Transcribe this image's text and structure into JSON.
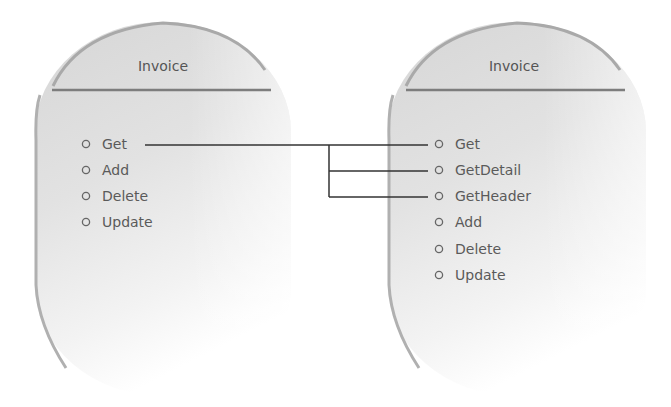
{
  "diagram": {
    "left_object": {
      "title": "Invoice",
      "methods": [
        "Get",
        "Add",
        "Delete",
        "Update"
      ]
    },
    "right_object": {
      "title": "Invoice",
      "methods": [
        "Get",
        "GetDetail",
        "GetHeader",
        "Add",
        "Delete",
        "Update"
      ]
    },
    "connector": {
      "from": "Get",
      "to": [
        "Get",
        "GetDetail",
        "GetHeader"
      ]
    },
    "colors": {
      "shape_fill_top": "#d9d9d9",
      "shape_fill_bottom": "#ffffff",
      "rim": "#a8a8a8",
      "separator": "#7a7a7a",
      "line": "#333333",
      "text": "#5a5a5a",
      "bullet": "#666666"
    }
  }
}
